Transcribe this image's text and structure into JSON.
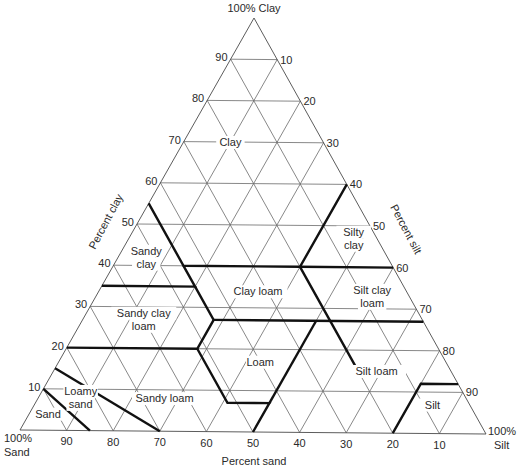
{
  "diagram": {
    "type": "ternary soil texture triangle",
    "corners": {
      "top": {
        "label": "100% Clay",
        "xy": [
          254,
          18
        ]
      },
      "bottom_left": {
        "label_line1": "100%",
        "label_line2": "Sand",
        "xy": [
          20,
          430
        ]
      },
      "bottom_right": {
        "label_line1": "100%",
        "label_line2": "Silt",
        "xy": [
          486,
          434
        ]
      }
    },
    "axes": {
      "clay": {
        "title": "Percent clay",
        "ticks": [
          "90",
          "80",
          "70",
          "60",
          "50",
          "40",
          "30",
          "20",
          "10"
        ],
        "values": [
          90,
          80,
          70,
          60,
          50,
          40,
          30,
          20,
          10
        ]
      },
      "silt": {
        "title": "Percent silt",
        "ticks": [
          "10",
          "20",
          "30",
          "40",
          "50",
          "60",
          "70",
          "80",
          "90"
        ],
        "values": [
          10,
          20,
          30,
          40,
          50,
          60,
          70,
          80,
          90
        ]
      },
      "sand": {
        "title": "Percent sand",
        "ticks": [
          "90",
          "80",
          "70",
          "60",
          "50",
          "40",
          "30",
          "20",
          "10"
        ],
        "values": [
          90,
          80,
          70,
          60,
          50,
          40,
          30,
          20,
          10
        ]
      }
    },
    "classes": [
      {
        "name": "Clay",
        "lines": [
          "Clay"
        ],
        "at": {
          "sand": 20,
          "clay": 70,
          "silt": 10
        }
      },
      {
        "name": "Sandy clay",
        "lines": [
          "Sandy",
          "clay"
        ],
        "at": {
          "sand": 52,
          "clay": 42,
          "silt": 6
        }
      },
      {
        "name": "Silty clay",
        "lines": [
          "Silty",
          "clay"
        ],
        "at": {
          "sand": 5,
          "clay": 47,
          "silt": 48
        }
      },
      {
        "name": "Clay loam",
        "lines": [
          "Clay loam"
        ],
        "at": {
          "sand": 32,
          "clay": 34,
          "silt": 34
        }
      },
      {
        "name": "Silt clay loam",
        "lines": [
          "Silt clay",
          "loam"
        ],
        "at": {
          "sand": 8,
          "clay": 33,
          "silt": 59
        }
      },
      {
        "name": "Sandy clay loam",
        "lines": [
          "Sandy clay",
          "loam"
        ],
        "at": {
          "sand": 60,
          "clay": 27,
          "silt": 13
        }
      },
      {
        "name": "Loam",
        "lines": [
          "Loam"
        ],
        "at": {
          "sand": 40,
          "clay": 17,
          "silt": 43
        }
      },
      {
        "name": "Silt loam",
        "lines": [
          "Silt loam"
        ],
        "at": {
          "sand": 16,
          "clay": 15,
          "silt": 69
        }
      },
      {
        "name": "Sandy loam",
        "lines": [
          "Sandy loam"
        ],
        "at": {
          "sand": 65,
          "clay": 8,
          "silt": 27
        }
      },
      {
        "name": "Loamy sand",
        "lines": [
          "Loamy",
          "sand"
        ],
        "at": {
          "sand": 83,
          "clay": 8,
          "silt": 9
        }
      },
      {
        "name": "Sand",
        "lines": [
          "Sand"
        ],
        "at": {
          "sand": 92,
          "clay": 4,
          "silt": 4
        }
      },
      {
        "name": "Silt",
        "lines": [
          "Silt"
        ],
        "at": {
          "sand": 8,
          "clay": 7,
          "silt": 85
        }
      }
    ],
    "boundaries": [
      [
        [
          45,
          55
        ],
        [
          45,
          40
        ],
        [
          20,
          40
        ],
        [
          0,
          60
        ]
      ],
      [
        [
          45,
          40
        ],
        [
          45,
          35
        ],
        [
          65,
          35
        ]
      ],
      [
        [
          20,
          40
        ],
        [
          0,
          40
        ]
      ],
      [
        [
          45,
          35
        ],
        [
          45,
          27
        ],
        [
          52,
          20
        ],
        [
          80,
          20
        ]
      ],
      [
        [
          45,
          27
        ],
        [
          0,
          27
        ]
      ],
      [
        [
          20,
          40
        ],
        [
          20,
          27
        ],
        [
          20,
          16
        ]
      ],
      [
        [
          52,
          20
        ],
        [
          52,
          7
        ],
        [
          43,
          7
        ],
        [
          50,
          0
        ]
      ],
      [
        [
          43,
          7
        ],
        [
          23,
          27
        ]
      ],
      [
        [
          20,
          0
        ],
        [
          8,
          12
        ],
        [
          0,
          12
        ]
      ],
      [
        [
          85,
          15
        ],
        [
          70,
          0
        ]
      ],
      [
        [
          90,
          10
        ],
        [
          85,
          0
        ]
      ]
    ],
    "colors": {
      "grid": "#6a6a6a",
      "boundary": "#111111",
      "text": "#2a2a2a",
      "background": "#ffffff"
    }
  }
}
